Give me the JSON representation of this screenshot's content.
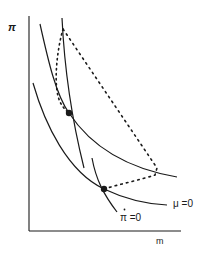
{
  "diagram": {
    "axes": {
      "y_label": "π",
      "x_label": "m"
    },
    "curves": {
      "mu_zero_label": "μ =0",
      "pi_dot_zero_label": "π =0",
      "pi_dot_accent": "·"
    },
    "colors": {
      "ink": "#1a1a1a",
      "background": "#ffffff"
    },
    "equilibria": [
      {
        "name": "upper-equilibrium",
        "x": 69,
        "y": 113
      },
      {
        "name": "lower-equilibrium",
        "x": 104,
        "y": 189
      }
    ]
  }
}
